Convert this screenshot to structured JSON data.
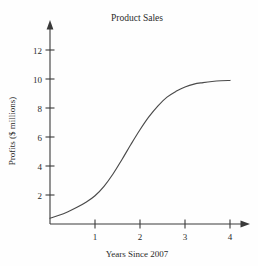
{
  "chart_data": {
    "type": "line",
    "title": "Product Sales",
    "xlabel": "Years Since 2007",
    "ylabel": "Profits ($ millions)",
    "xlim": [
      0,
      4.4
    ],
    "ylim": [
      0,
      13.2
    ],
    "xticks": [
      "1",
      "2",
      "3",
      "4"
    ],
    "xtick_values": [
      1,
      2,
      3,
      4
    ],
    "yticks": [
      "2",
      "4",
      "6",
      "8",
      "10",
      "12"
    ],
    "ytick_values": [
      2,
      4,
      6,
      8,
      10,
      12
    ],
    "grid": false,
    "legend": "none",
    "series": [
      {
        "name": "Profits",
        "x": [
          0,
          0.2,
          0.4,
          0.6,
          0.8,
          1.0,
          1.2,
          1.4,
          1.6,
          1.8,
          2.0,
          2.2,
          2.4,
          2.6,
          2.8,
          3.0,
          3.2,
          3.4,
          3.6,
          3.8,
          4.0
        ],
        "values": [
          0.4,
          0.6,
          0.85,
          1.15,
          1.5,
          1.95,
          2.6,
          3.45,
          4.45,
          5.5,
          6.5,
          7.4,
          8.15,
          8.75,
          9.15,
          9.45,
          9.65,
          9.75,
          9.83,
          9.88,
          9.9
        ]
      }
    ]
  },
  "figure": {
    "title_label": "Product Sales",
    "x_axis_label": "Years Since 2007",
    "y_axis_label": "Profits ($ millions)",
    "x_tick_labels": [
      "1",
      "2",
      "3",
      "4"
    ],
    "y_tick_labels": [
      "2",
      "4",
      "6",
      "8",
      "10",
      "12"
    ],
    "curve_color": "#4a4a4a",
    "axis_color": "#3a3a3a",
    "background_color": "#fefefe"
  }
}
